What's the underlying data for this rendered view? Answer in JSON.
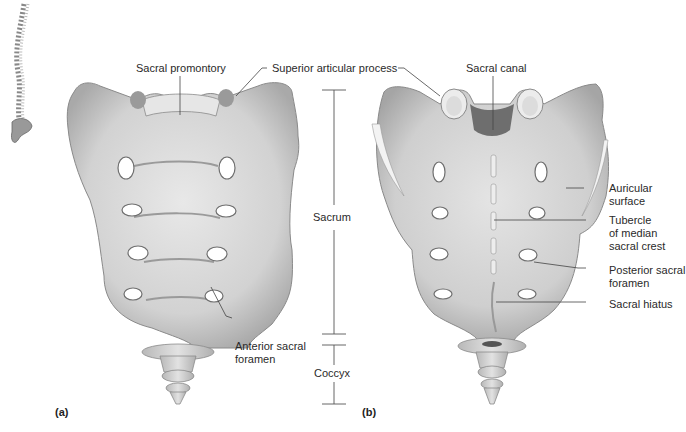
{
  "figure": {
    "panels": [
      {
        "id": "a",
        "tag": "(a)",
        "view": "anterior"
      },
      {
        "id": "b",
        "tag": "(b)",
        "view": "posterior"
      }
    ]
  },
  "labels": {
    "sacral_promontory": "Sacral promontory",
    "superior_articular_process": "Superior articular process",
    "sacral_canal": "Sacral canal",
    "sacrum": "Sacrum",
    "coccyx": "Coccyx",
    "anterior_sacral_foramen": "Anterior sacral\nforamen",
    "auricular_surface": "Auricular\nsurface",
    "tubercle_median_sacral_crest": "Tubercle\nof median\nsacral crest",
    "posterior_sacral_foramen": "Posterior sacral\nforamen",
    "sacral_hiatus": "Sacral hiatus"
  },
  "colors": {
    "bone_fill": "#d9d9d9",
    "bone_shadow": "#a8a8a8",
    "bone_outline": "#7a7a7a",
    "foramen": "#ffffff",
    "leader_line": "#444444"
  }
}
